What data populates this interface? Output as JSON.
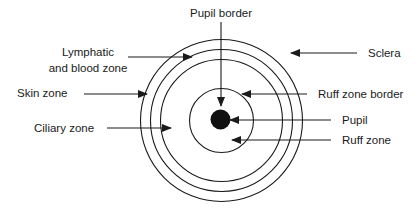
{
  "diagram": {
    "type": "iris-zones-diagram",
    "stroke_color": "#1a1a1a",
    "background": "#ffffff",
    "labels": {
      "pupil_border": "Pupil border",
      "lymphatic_line1": "Lymphatic",
      "lymphatic_line2": "and blood zone",
      "skin_zone": "Skin zone",
      "ciliary_zone": "Ciliary zone",
      "sclera": "Sclera",
      "ruff_zone_border": "Ruff zone border",
      "pupil": "Pupil",
      "ruff_zone": "Ruff zone"
    },
    "circles": [
      {
        "name": "outer-skin-circle",
        "cx": 221.5,
        "cy": 120.5,
        "r": 81
      },
      {
        "name": "lymphatic-circle",
        "cx": 221.5,
        "cy": 120.5,
        "r": 71
      },
      {
        "name": "ciliary-circle",
        "cx": 221.5,
        "cy": 120.5,
        "r": 61
      },
      {
        "name": "ruff-zone-circle",
        "cx": 221.5,
        "cy": 120.5,
        "r": 32
      }
    ],
    "pupil": {
      "cx": 220.5,
      "cy": 119.5,
      "r": 10
    }
  }
}
